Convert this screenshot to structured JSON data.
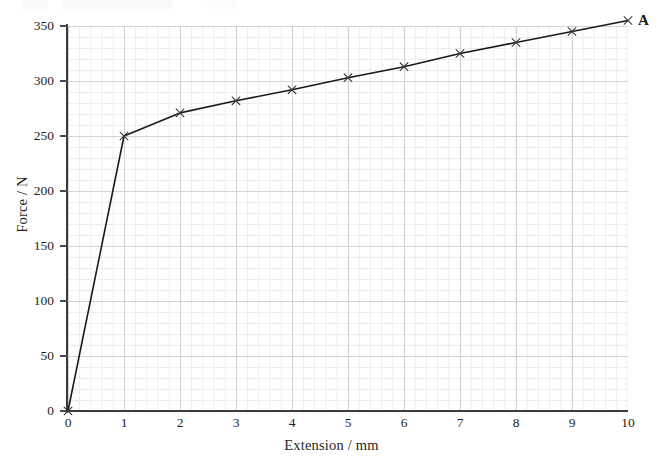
{
  "figure": {
    "caption_artifact": "",
    "endpoint_label": "A"
  },
  "chart_data": {
    "type": "line",
    "title": "",
    "xlabel": "Extension / mm",
    "ylabel": "Force / N",
    "xlim": [
      0,
      10
    ],
    "ylim": [
      0,
      350
    ],
    "xticks": [
      "0",
      "1",
      "2",
      "3",
      "4",
      "5",
      "6",
      "7",
      "8",
      "9",
      "10"
    ],
    "xtick_values": [
      0,
      1,
      2,
      3,
      4,
      5,
      6,
      7,
      8,
      9,
      10
    ],
    "yticks": [
      "0",
      "50",
      "100",
      "150",
      "200",
      "250",
      "300",
      "350"
    ],
    "ytick_values": [
      0,
      50,
      100,
      150,
      200,
      250,
      300,
      350
    ],
    "grid": "major and minor gridlines, minor = 1/5 of major",
    "legend": "none",
    "marker": "cross",
    "line_color": "#1a1a1a",
    "grid_major_color": "#d3d3d5",
    "grid_minor_color": "#ececed",
    "axis_color": "#3b3b3f",
    "x": [
      0,
      1,
      2,
      3,
      4,
      5,
      6,
      7,
      8,
      9,
      10
    ],
    "values": [
      0,
      250,
      271,
      282,
      292,
      303,
      313,
      325,
      335,
      345,
      355
    ],
    "annotations": [
      {
        "label": "A",
        "x": 10,
        "y": 355
      }
    ]
  }
}
